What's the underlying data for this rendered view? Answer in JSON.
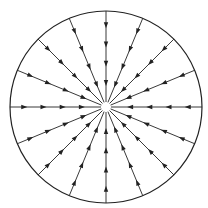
{
  "diagram": {
    "type": "radial-vector-field",
    "circle": {
      "cx": 106,
      "cy": 107,
      "r": 96
    },
    "line_count": 16,
    "arrows_per_line": 4,
    "arrow_direction": "inward",
    "arrow_positions": [
      0.22,
      0.42,
      0.62,
      0.82
    ],
    "center_gap": 5,
    "colors": {
      "stroke": "#222222",
      "background": "#ffffff"
    }
  }
}
